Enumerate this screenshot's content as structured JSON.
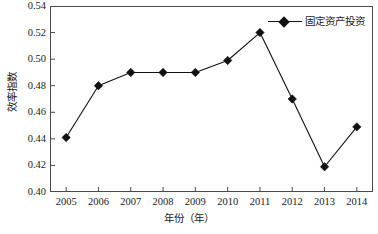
{
  "chart_data": {
    "type": "line",
    "title": "",
    "xlabel": "年份（年）",
    "ylabel": "效率指数",
    "categories": [
      "2005",
      "2006",
      "2007",
      "2008",
      "2009",
      "2010",
      "2011",
      "2012",
      "2013",
      "2014"
    ],
    "series": [
      {
        "name": "固定资产投资",
        "values": [
          0.441,
          0.48,
          0.49,
          0.49,
          0.49,
          0.499,
          0.52,
          0.47,
          0.419,
          0.449
        ],
        "color": "#111111",
        "marker": "diamond"
      }
    ],
    "ylim": [
      0.4,
      0.54
    ],
    "ytick_step": 0.02,
    "yticks": [
      "0.54",
      "0.52",
      "0.50",
      "0.48",
      "0.46",
      "0.44",
      "0.42",
      "0.40"
    ],
    "ytick_values": [
      0.54,
      0.52,
      0.5,
      0.48,
      0.46,
      0.44,
      0.42,
      0.4
    ],
    "grid": false,
    "legend_position": "top-right",
    "legend_entries": [
      "固定资产投资"
    ],
    "axis_color": "#4a4a4a",
    "line_color": "#111111"
  }
}
